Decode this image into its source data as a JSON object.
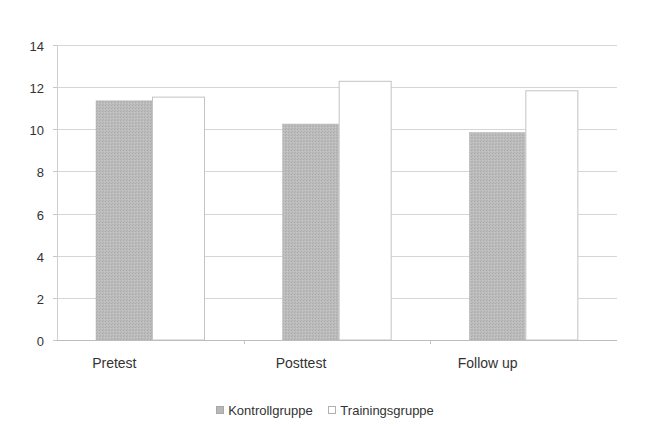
{
  "chart_data": {
    "type": "bar",
    "title": "",
    "xlabel": "",
    "ylabel": "",
    "categories": [
      "Pretest",
      "Posttest",
      "Follow up"
    ],
    "series": [
      {
        "name": "Kontrollgruppe",
        "values": [
          11.35,
          10.25,
          9.85
        ],
        "color": "#b8b8b8"
      },
      {
        "name": "Trainingsgruppe",
        "values": [
          11.55,
          12.3,
          11.85
        ],
        "color": "#ffffff"
      }
    ],
    "ylim": [
      0,
      14
    ],
    "yticks": [
      0,
      2,
      4,
      6,
      8,
      10,
      12,
      14
    ],
    "grid": true,
    "legend_position": "bottom"
  },
  "legend": {
    "items": [
      {
        "label": "Kontrollgruppe"
      },
      {
        "label": "Trainingsgruppe"
      }
    ]
  }
}
